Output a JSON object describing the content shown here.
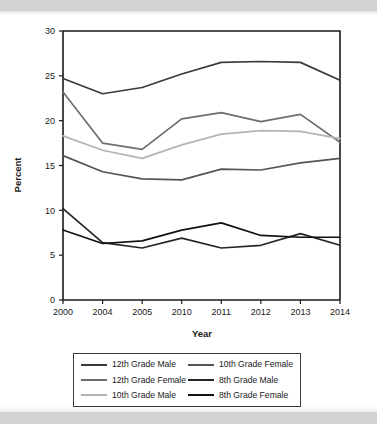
{
  "figure": {
    "background": "#ffffff",
    "band_color": "#d2d2d2"
  },
  "chart_data": {
    "type": "line",
    "title": "",
    "xlabel": "Year",
    "ylabel": "Percent",
    "categories": [
      "2000",
      "2004",
      "2005",
      "2010",
      "2011",
      "2012",
      "2013",
      "2014"
    ],
    "x": [
      2000,
      2004,
      2005,
      2010,
      2011,
      2012,
      2013,
      2014
    ],
    "ylim": [
      0,
      30
    ],
    "yticks": [
      0,
      5,
      10,
      15,
      20,
      25,
      30
    ],
    "ytick_labels": [
      "0",
      "5",
      "10",
      "15",
      "20",
      "25",
      "30"
    ],
    "grid": false,
    "legend_position": "below-axes",
    "series": [
      {
        "name": "12th Grade Male",
        "color": "#3a3a3a",
        "values": [
          24.7,
          23.0,
          23.7,
          25.2,
          26.5,
          26.6,
          26.5,
          24.5
        ]
      },
      {
        "name": "12th Grade Female",
        "color": "#6e6e6e",
        "values": [
          23.2,
          17.5,
          16.8,
          20.2,
          20.9,
          19.9,
          20.7,
          17.6
        ]
      },
      {
        "name": "10th Grade Male",
        "color": "#b4b4b4",
        "values": [
          18.3,
          16.7,
          15.8,
          17.3,
          18.5,
          18.9,
          18.8,
          18.0
        ]
      },
      {
        "name": "10th Grade Female",
        "color": "#555555",
        "values": [
          16.1,
          14.3,
          13.5,
          13.4,
          14.6,
          14.5,
          15.3,
          15.8
        ]
      },
      {
        "name": "8th Grade Male",
        "color": "#262626",
        "values": [
          10.2,
          6.4,
          5.8,
          6.9,
          5.8,
          6.1,
          7.4,
          6.1
        ]
      },
      {
        "name": "8th Grade Female",
        "color": "#111111",
        "values": [
          7.8,
          6.3,
          6.6,
          7.8,
          8.6,
          7.2,
          7.0,
          7.0
        ]
      }
    ]
  },
  "legend": {
    "items": [
      {
        "label": "12th Grade Male",
        "color": "#3a3a3a"
      },
      {
        "label": "10th Grade Female",
        "color": "#555555"
      },
      {
        "label": "12th Grade Female",
        "color": "#6e6e6e"
      },
      {
        "label": "8th Grade Male",
        "color": "#262626"
      },
      {
        "label": "10th Grade Male",
        "color": "#b4b4b4"
      },
      {
        "label": "8th Grade Female",
        "color": "#111111"
      }
    ]
  }
}
